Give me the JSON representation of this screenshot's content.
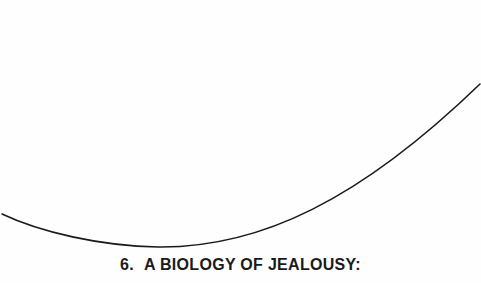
{
  "page": {
    "chapter": {
      "number": "6.",
      "title": "A BIOLOGY OF JEALOUSY:"
    },
    "decoration": {
      "type": "arc",
      "stroke_color": "#1a1a1a"
    }
  }
}
